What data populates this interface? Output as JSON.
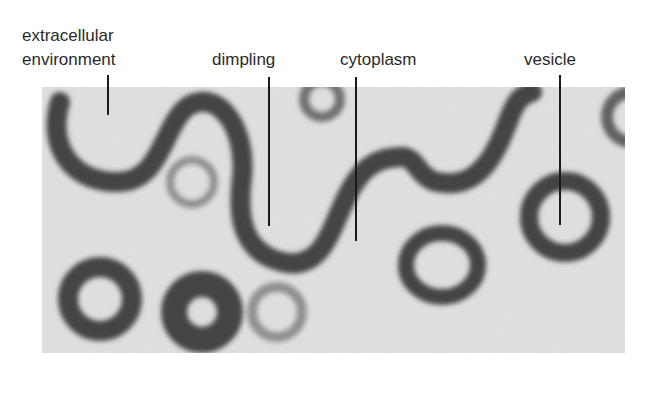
{
  "figure": {
    "type": "electron-micrograph",
    "labels": [
      {
        "id": "extracellular",
        "line1": "extracellular",
        "line2": "environment"
      },
      {
        "id": "dimpling",
        "text": "dimpling"
      },
      {
        "id": "cytoplasm",
        "text": "cytoplasm"
      },
      {
        "id": "vesicle",
        "text": "vesicle"
      }
    ],
    "colors": {
      "membrane": "#2b2b2b",
      "background": "#d0d0d0",
      "text": "#2a2a2a"
    }
  }
}
